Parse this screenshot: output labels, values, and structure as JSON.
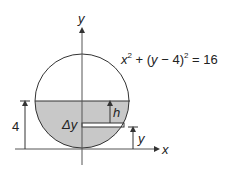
{
  "diagram": {
    "equation": {
      "x": "x",
      "exp1": "2",
      "mid": " + (",
      "y": "y",
      "rest": " − 4)",
      "exp2": "2",
      "end": " = 16"
    },
    "labels": {
      "y_axis": "y",
      "x_axis": "x",
      "h": "h",
      "delta_y": "Δy",
      "y_height": "y",
      "four": "4"
    },
    "colors": {
      "fill": "#c8c8c8",
      "line": "#333333"
    }
  }
}
